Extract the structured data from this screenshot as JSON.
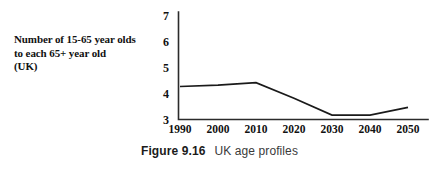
{
  "figure": {
    "number_label": "Figure 9.16",
    "title": "UK age profiles"
  },
  "axis_label": {
    "line1": "Number of 15-65 year olds",
    "line2": "to each 65+ year old",
    "line3": "(UK)"
  },
  "colors": {
    "line": "#1a1a1a",
    "axis": "#2b2b2b",
    "text": "#111111",
    "background": "#ffffff"
  },
  "chart_data": {
    "type": "line",
    "title": "UK age profiles",
    "xlabel": "",
    "ylabel": "Number of 15-65 year olds to each 65+ year old (UK)",
    "x": [
      1990,
      2000,
      2010,
      2020,
      2030,
      2040,
      2050
    ],
    "categories": [
      "1990",
      "2000",
      "2010",
      "2020",
      "2030",
      "2040",
      "2050"
    ],
    "values": [
      4.25,
      4.3,
      4.4,
      3.8,
      3.15,
      3.15,
      3.45
    ],
    "series": [
      {
        "name": "Number of 15-65 year olds to each 65+ year old (UK)",
        "values": [
          4.25,
          4.3,
          4.4,
          3.8,
          3.15,
          3.15,
          3.45
        ]
      }
    ],
    "ylim": [
      3,
      7
    ],
    "yticks": [
      3,
      4,
      5,
      6,
      7
    ],
    "ytick_labels": [
      "3",
      "4",
      "5",
      "6",
      "7"
    ],
    "xlim": [
      1990,
      2050
    ],
    "xticks": [
      1990,
      2000,
      2010,
      2020,
      2030,
      2040,
      2050
    ],
    "xtick_labels": [
      "1990",
      "2000",
      "2010",
      "2020",
      "2030",
      "2040",
      "2050"
    ],
    "grid": false,
    "legend": false,
    "legend_position": "none"
  }
}
